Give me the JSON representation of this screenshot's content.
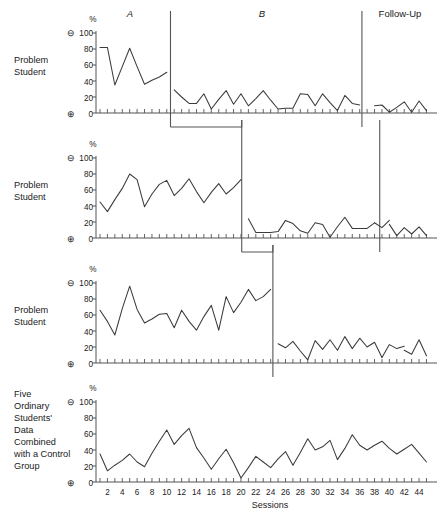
{
  "figure": {
    "phase_labels": [
      {
        "name": "A",
        "x": 130,
        "italic": true
      },
      {
        "name": "B",
        "x": 262,
        "italic": true
      },
      {
        "name": "Follow-Up",
        "x": 400,
        "italic": false
      }
    ],
    "xaxis_title": "Sessions",
    "percent_symbol": "%",
    "minus_symbol": "⊖",
    "plus_symbol": "⊕",
    "y_ticks": [
      "0",
      "20",
      "40",
      "60",
      "80",
      "100"
    ],
    "x_ticks": [
      "2",
      "4",
      "6",
      "8",
      "10",
      "12",
      "14",
      "16",
      "18",
      "20",
      "22",
      "24",
      "26",
      "28",
      "30",
      "32",
      "34",
      "36",
      "38",
      "40",
      "42",
      "44"
    ],
    "line_color": "#3b3b3b",
    "axis_color": "#555555",
    "panel_labels": [
      [
        "Problem",
        "Student"
      ],
      [
        "Problem",
        "Student"
      ],
      [
        "Problem",
        "Student"
      ],
      [
        "Five",
        "Ordinary",
        "Students'",
        "Data",
        "Combined",
        "with a Control",
        "Group"
      ]
    ]
  },
  "chart_data": [
    {
      "type": "line",
      "title": "Problem Student 1",
      "xlabel": "Sessions",
      "ylabel": "%",
      "ylim": [
        0,
        100
      ],
      "xlim": [
        1,
        45
      ],
      "grid": false,
      "phases": [
        {
          "label": "A",
          "start_session": 1,
          "end_session": 10
        },
        {
          "label": "B",
          "start_session": 11,
          "end_session": 36
        },
        {
          "label": "Follow-Up",
          "start_session": 37,
          "end_session": 45
        }
      ],
      "phase_line_sessions": [
        10.5,
        36.3
      ],
      "segments": [
        {
          "phase": "A",
          "x": [
            1,
            2,
            3,
            4,
            5,
            6,
            7,
            8,
            9,
            10
          ],
          "y": [
            82,
            82,
            35,
            58,
            81,
            58,
            36,
            41,
            45,
            51
          ]
        },
        {
          "phase": "B",
          "x": [
            11,
            12,
            13,
            14,
            15,
            16,
            17,
            18,
            19,
            20,
            21,
            22,
            23,
            24,
            25,
            26,
            27,
            28,
            29,
            30,
            31,
            32,
            33,
            34,
            35,
            36
          ],
          "y": [
            29,
            20,
            12,
            12,
            24,
            5,
            17,
            28,
            11,
            24,
            9,
            18,
            28,
            16,
            5,
            6,
            6,
            24,
            23,
            9,
            24,
            13,
            3,
            22,
            12,
            10
          ]
        },
        {
          "phase": "Follow-Up",
          "x": [
            38,
            39,
            40,
            41,
            42,
            43,
            44,
            45
          ],
          "y": [
            9,
            10,
            1,
            7,
            14,
            1,
            15,
            3
          ]
        }
      ]
    },
    {
      "type": "line",
      "title": "Problem Student 2",
      "xlabel": "Sessions",
      "ylabel": "%",
      "ylim": [
        0,
        100
      ],
      "xlim": [
        1,
        45
      ],
      "grid": false,
      "phases": [
        {
          "label": "A",
          "start_session": 1,
          "end_session": 20
        },
        {
          "label": "B",
          "start_session": 21,
          "end_session": 42
        },
        {
          "label": "Follow-Up",
          "start_session": 43,
          "end_session": 45
        }
      ],
      "phase_line_sessions": [
        20.1,
        38.7
      ],
      "segments": [
        {
          "phase": "A",
          "x": [
            1,
            2,
            3,
            4,
            5,
            6,
            7,
            8,
            9,
            10,
            11,
            12,
            13,
            14,
            15,
            16,
            17,
            18,
            19,
            20
          ],
          "y": [
            45,
            33,
            48,
            62,
            80,
            73,
            39,
            55,
            67,
            72,
            53,
            62,
            74,
            58,
            44,
            57,
            68,
            55,
            63,
            73
          ]
        },
        {
          "phase": "B",
          "x": [
            21,
            22,
            23,
            24,
            25,
            26,
            27,
            28,
            29,
            30,
            31,
            32,
            33,
            34,
            35,
            36,
            37,
            38
          ],
          "y": [
            24,
            7,
            7,
            7,
            8,
            22,
            18,
            9,
            6,
            19,
            17,
            1,
            14,
            26,
            12,
            12,
            12,
            19
          ]
        },
        {
          "phase": "B2",
          "x": [
            38,
            39,
            40
          ],
          "y": [
            19,
            13,
            22
          ]
        },
        {
          "phase": "Follow-Up",
          "x": [
            40,
            41,
            42,
            43,
            44,
            45
          ],
          "y": [
            17,
            3,
            13,
            5,
            14,
            3
          ]
        }
      ]
    },
    {
      "type": "line",
      "title": "Problem Student 3",
      "xlabel": "Sessions",
      "ylabel": "%",
      "ylim": [
        0,
        100
      ],
      "xlim": [
        1,
        45
      ],
      "grid": false,
      "phases": [
        {
          "label": "A",
          "start_session": 1,
          "end_session": 24
        },
        {
          "label": "B",
          "start_session": 25,
          "end_session": 45
        }
      ],
      "phase_line_sessions": [
        24.3
      ],
      "segments": [
        {
          "phase": "A",
          "x": [
            1,
            2,
            3,
            4,
            5,
            6,
            7,
            8,
            9,
            10,
            11,
            12,
            13,
            14,
            15,
            16,
            17,
            18,
            19,
            20,
            21,
            22,
            23,
            24
          ],
          "y": [
            66,
            52,
            35,
            68,
            96,
            67,
            50,
            55,
            61,
            62,
            44,
            66,
            52,
            41,
            58,
            72,
            41,
            83,
            63,
            76,
            92,
            78,
            83,
            92,
            82
          ]
        },
        {
          "phase": "B",
          "x": [
            25,
            26,
            27,
            28,
            29,
            30,
            31,
            32,
            33,
            34,
            35,
            36,
            37,
            38,
            39
          ],
          "y": [
            24,
            19,
            27,
            15,
            4,
            28,
            17,
            29,
            16,
            33,
            18,
            31,
            20,
            26,
            7
          ]
        },
        {
          "phase": "B2",
          "x": [
            39,
            40,
            41,
            42
          ],
          "y": [
            7,
            23,
            18,
            21,
            16
          ]
        },
        {
          "phase": "B3",
          "x": [
            42,
            43,
            44,
            45
          ],
          "y": [
            16,
            11,
            29,
            9
          ]
        }
      ]
    },
    {
      "type": "line",
      "title": "Five Ordinary Students' Data Combined with a Control Group",
      "xlabel": "Sessions",
      "ylabel": "%",
      "ylim": [
        0,
        100
      ],
      "xlim": [
        1,
        45
      ],
      "grid": false,
      "phases": [],
      "phase_line_sessions": [],
      "segments": [
        {
          "phase": "All",
          "x": [
            1,
            2,
            3,
            4,
            5,
            6,
            7,
            8,
            9,
            10,
            11,
            12,
            13,
            14,
            15,
            16,
            17,
            18,
            19,
            20,
            21,
            22,
            23,
            24,
            25,
            26,
            27,
            28,
            29,
            30,
            31,
            32,
            33,
            34,
            35,
            36,
            37,
            38,
            39,
            40,
            41,
            42,
            43,
            44,
            45
          ],
          "y": [
            35,
            14,
            21,
            27,
            35,
            25,
            19,
            36,
            51,
            65,
            47,
            58,
            67,
            43,
            30,
            16,
            29,
            41,
            24,
            5,
            18,
            32,
            25,
            18,
            29,
            38,
            21,
            37,
            54,
            40,
            44,
            52,
            28,
            42,
            59,
            46,
            40,
            46,
            51,
            42,
            35,
            41,
            47,
            36,
            25
          ]
        }
      ]
    }
  ]
}
